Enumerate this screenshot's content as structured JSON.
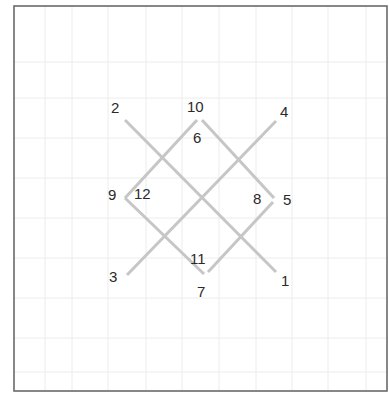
{
  "diagram": {
    "type": "numbered-line-crossing-puzzle",
    "frame": {
      "x": 14,
      "y": 6,
      "width": 373,
      "height": 385,
      "color": "#6a6a6a"
    },
    "grid_color": "#ececec",
    "line_color": "#c6c6c6",
    "label_color": "#2a2a2a",
    "grid": {
      "vertical": [
        45,
        72,
        108,
        146,
        182,
        219,
        256,
        292,
        328,
        366
      ],
      "horizontal": [
        62,
        98,
        138,
        178,
        218,
        258,
        298,
        338,
        372
      ]
    },
    "segments": [
      {
        "id": "long-diagonal-2-1",
        "x1": 125,
        "y1": 120,
        "x2": 276,
        "y2": 272
      },
      {
        "id": "long-diagonal-4-3",
        "x1": 276,
        "y1": 121,
        "x2": 127,
        "y2": 275
      },
      {
        "id": "diamond-edge-10-5",
        "x1": 202,
        "y1": 120,
        "x2": 274,
        "y2": 198
      },
      {
        "id": "diamond-edge-10-9",
        "x1": 197,
        "y1": 120,
        "x2": 125,
        "y2": 198
      },
      {
        "id": "diamond-edge-9-7",
        "x1": 125,
        "y1": 198,
        "x2": 204,
        "y2": 274
      },
      {
        "id": "diamond-edge-7-5",
        "x1": 208,
        "y1": 272,
        "x2": 273,
        "y2": 202
      }
    ],
    "labels": [
      {
        "text": "2",
        "x": 111,
        "y": 113
      },
      {
        "text": "10",
        "x": 187,
        "y": 112
      },
      {
        "text": "4",
        "x": 280,
        "y": 117
      },
      {
        "text": "6",
        "x": 193,
        "y": 143
      },
      {
        "text": "9",
        "x": 108,
        "y": 200
      },
      {
        "text": "12",
        "x": 134,
        "y": 199
      },
      {
        "text": "8",
        "x": 253,
        "y": 204
      },
      {
        "text": "5",
        "x": 283,
        "y": 205
      },
      {
        "text": "11",
        "x": 190,
        "y": 264
      },
      {
        "text": "3",
        "x": 109,
        "y": 282
      },
      {
        "text": "7",
        "x": 197,
        "y": 297
      },
      {
        "text": "1",
        "x": 281,
        "y": 286
      }
    ]
  }
}
